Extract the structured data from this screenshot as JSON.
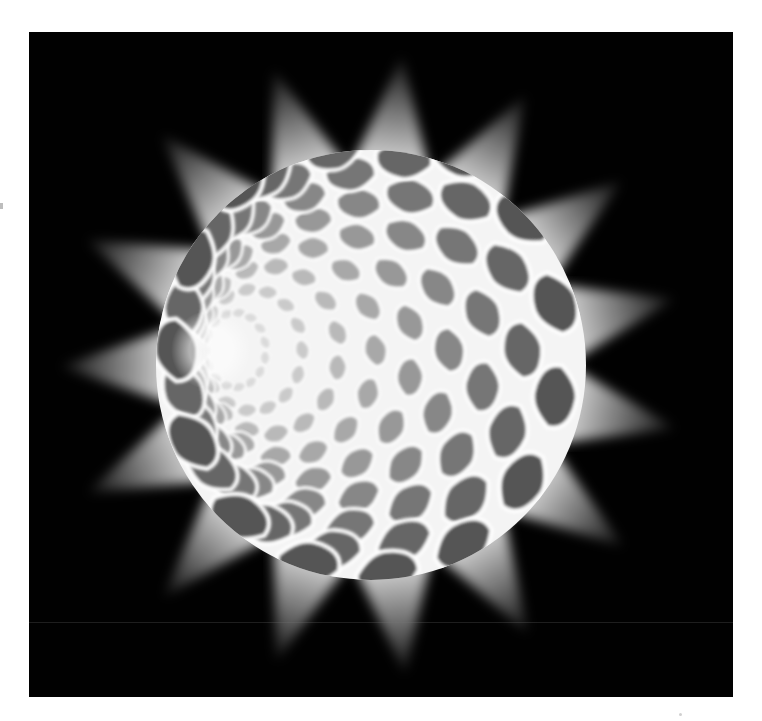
{
  "image": {
    "subject": "Illuminated spherical lattice lamp sculpture casting star-shaped light rays",
    "alt": "Glowing sphere made of curved diamond-shaped cells radiating from a pole, with triangular light beams behind it on a black background"
  },
  "colors": {
    "page_background": "#ffffff",
    "photo_background": "#010101",
    "light": "#ffffff",
    "cell_dark": "#4a4a4a",
    "cell_mid": "#8a8a8a"
  },
  "geometry": {
    "frame": {
      "x": 29,
      "y": 32,
      "width": 704,
      "height": 665
    },
    "sphere_center": {
      "x": 342,
      "y": 333
    },
    "sphere_radius": 215,
    "pole": {
      "x": 182,
      "y": 318
    },
    "ray_count": 15,
    "ray_length": 300,
    "ring_count": 9,
    "cells_per_ring": 15,
    "scan_line_y": 590
  }
}
